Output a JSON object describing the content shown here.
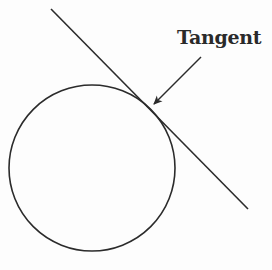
{
  "diagram": {
    "label": "Tangent",
    "stroke_color": "#2b2b2b",
    "circle": {
      "cx": 92,
      "cy": 168,
      "r": 83
    },
    "tangent_line": {
      "x1": 51,
      "y1": 9,
      "x2": 248,
      "y2": 209
    },
    "arrow": {
      "x1": 201,
      "y1": 57,
      "x2": 154,
      "y2": 104
    },
    "elements": [
      {
        "type": "circle",
        "name": "circle"
      },
      {
        "type": "line",
        "name": "tangent-line",
        "touches": "circle"
      },
      {
        "type": "arrow",
        "name": "label-arrow",
        "points_to": "point-of-tangency"
      },
      {
        "type": "text",
        "name": "tangent-label",
        "text": "Tangent"
      }
    ]
  }
}
